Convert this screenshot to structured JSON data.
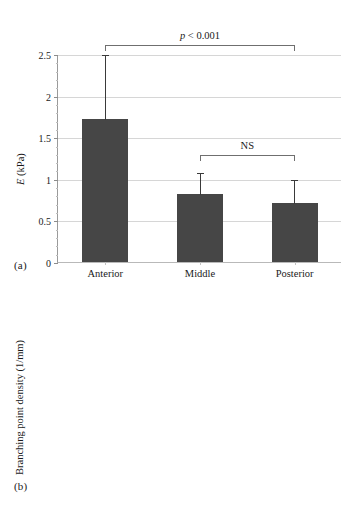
{
  "figure": {
    "background": "#ffffff",
    "bar_color": "#464646",
    "grid_color": "#d6d6d6",
    "axis_color": "#9a9a9a"
  },
  "panels": [
    {
      "id": "a",
      "panel_label": "(a)",
      "chart_data": {
        "type": "bar",
        "title": "",
        "xlabel": "",
        "ylabel": "E (kPa)",
        "ylabel_italic_part": "E",
        "ylabel_rest": " (kPa)",
        "ylim": [
          0,
          2.5
        ],
        "yticks": [
          0,
          0.5,
          1,
          1.5,
          2,
          2.5
        ],
        "ytick_labels": [
          "0",
          "0.5",
          "1",
          "1.5",
          "2",
          "2.5"
        ],
        "minor_tick_step": 0.1,
        "grid": true,
        "legend": "none",
        "categories": [
          "Anterior",
          "Middle",
          "Posterior"
        ],
        "values": [
          1.72,
          0.82,
          0.71
        ],
        "errors_upper": [
          0.78,
          0.26,
          0.29
        ],
        "error_tops": [
          2.5,
          1.08,
          1.0
        ],
        "annotations": [
          {
            "label": "p < 0.001",
            "label_italic": "p",
            "label_rest": " < 0.001",
            "from": "Anterior",
            "to": "Posterior",
            "y": 2.62
          },
          {
            "label": "NS",
            "from": "Middle",
            "to": "Posterior",
            "y": 1.3
          }
        ]
      }
    },
    {
      "id": "b",
      "panel_label": "(b)",
      "chart_data": {
        "type": "bar",
        "title": "",
        "xlabel": "",
        "ylabel": "Branching point density (1/mm)",
        "ylim": [
          0,
          30
        ],
        "yticks": [
          0,
          5,
          10,
          15,
          20,
          25,
          30
        ],
        "ytick_labels": [
          "0",
          "5",
          "10",
          "15",
          "20",
          "25",
          "30"
        ],
        "minor_tick_step": 1,
        "grid": true,
        "legend": "none",
        "categories": [
          "Anterior",
          "Middle",
          "Posterior"
        ],
        "values": [
          20.8,
          10.1,
          6.3
        ],
        "errors_upper": [
          4.4,
          2.1,
          1.7
        ],
        "error_tops": [
          25.2,
          12.2,
          8.0
        ],
        "annotations": [
          {
            "label": "p < 0.001",
            "label_italic": "p",
            "label_rest": " < 0.001",
            "from": "Anterior",
            "to": "Posterior",
            "y": 31.4
          },
          {
            "label": "NS",
            "from": "Middle",
            "to": "Posterior",
            "y": 16.6
          }
        ]
      }
    }
  ]
}
